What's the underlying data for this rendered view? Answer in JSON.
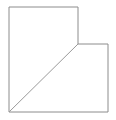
{
  "figure": {
    "name": "notched-square-with-diagonal",
    "canvas": {
      "width": 116,
      "height": 120,
      "background_color": "#ffffff"
    },
    "styles": {
      "outline_stroke_color": "#8c8c8c",
      "outline_fill_color": "#ffffff",
      "outline_stroke_width": 1,
      "diagonal_stroke_color": "#9a9a9a",
      "diagonal_stroke_width": 1
    },
    "outline": {
      "label": "L-shaped outline",
      "points": "9,7 78,7 78,44 108,44 108,112 9,112",
      "vertices": [
        {
          "name": "top-left",
          "x": 9,
          "y": 7
        },
        {
          "name": "top-right-of-upper-block",
          "x": 78,
          "y": 7
        },
        {
          "name": "inner-notch-corner",
          "x": 78,
          "y": 44
        },
        {
          "name": "right-notch-corner",
          "x": 108,
          "y": 44
        },
        {
          "name": "bottom-right",
          "x": 108,
          "y": 112
        },
        {
          "name": "bottom-left",
          "x": 9,
          "y": 112
        }
      ]
    },
    "diagonal": {
      "label": "diagonal divider",
      "x1": 9,
      "y1": 112,
      "x2": 78,
      "y2": 44
    },
    "regions": [
      {
        "name": "lower-left-triangle",
        "label": "triangle"
      },
      {
        "name": "upper-right-quadrilateral",
        "label": "quadrilateral"
      }
    ]
  }
}
